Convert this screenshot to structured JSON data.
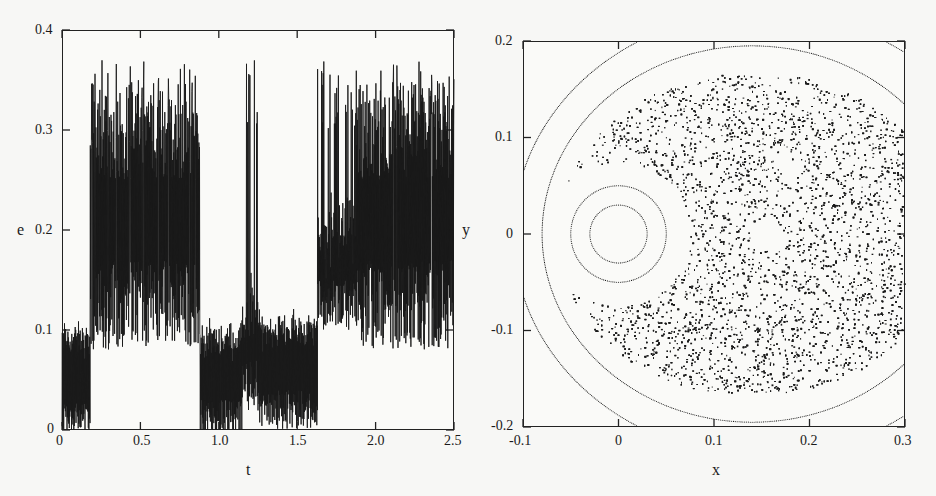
{
  "chart_data": [
    {
      "type": "line",
      "title": "",
      "xlabel": "t",
      "ylabel": "e",
      "xlim": [
        0,
        2.5
      ],
      "ylim": [
        0,
        0.4
      ],
      "x_ticks": [
        "0",
        "0.5",
        "1.0",
        "1.5",
        "2.0",
        "2.5"
      ],
      "y_ticks": [
        "0",
        "0.1",
        "0.2",
        "0.3",
        "0.4"
      ],
      "grid": false,
      "legend": null,
      "description": "Eccentricity e(t): rapidly oscillating signal switching between low state (~0.03-0.1) and high state (~0.15-0.36)",
      "segments": [
        {
          "t_start": 0.0,
          "t_end": 0.18,
          "state": "low",
          "band": [
            0.0,
            0.1
          ],
          "mean": 0.07
        },
        {
          "t_start": 0.18,
          "t_end": 0.88,
          "state": "high",
          "band": [
            0.1,
            0.36
          ],
          "mean": 0.2
        },
        {
          "t_start": 0.88,
          "t_end": 1.15,
          "state": "low",
          "band": [
            0.0,
            0.1
          ],
          "mean": 0.07
        },
        {
          "t_start": 1.15,
          "t_end": 1.25,
          "state": "spikes",
          "band": [
            0.05,
            0.37
          ],
          "mean": 0.12
        },
        {
          "t_start": 1.25,
          "t_end": 1.63,
          "state": "low",
          "band": [
            0.0,
            0.12
          ],
          "mean": 0.08
        },
        {
          "t_start": 1.63,
          "t_end": 1.88,
          "state": "spikes",
          "band": [
            0.1,
            0.37
          ],
          "mean": 0.2
        },
        {
          "t_start": 1.88,
          "t_end": 2.5,
          "state": "high",
          "band": [
            0.12,
            0.33
          ],
          "mean": 0.2
        }
      ],
      "peak_value": 0.37
    },
    {
      "type": "scatter",
      "title": "",
      "xlabel": "x",
      "ylabel": "y",
      "xlim": [
        -0.1,
        0.3
      ],
      "ylim": [
        -0.2,
        0.2
      ],
      "x_ticks": [
        "-0.1",
        "0",
        "0.1",
        "0.2",
        "0.3"
      ],
      "y_ticks": [
        "-0.2",
        "-0.1",
        "0",
        "0.1",
        "0.2"
      ],
      "grid": false,
      "legend": null,
      "description": "Poincare section: regular invariant circles around (0,0), chaotic sea filling x from ~-0.05 to 0.3, outer regular curves, small island near (0.15, 0)",
      "invariant_curves": [
        {
          "center": [
            0.0,
            0.0
          ],
          "radius": 0.03
        },
        {
          "center": [
            0.0,
            0.0
          ],
          "radius": 0.05
        },
        {
          "center": [
            0.14,
            0.0
          ],
          "rx": 0.22,
          "ry": 0.195
        },
        {
          "center": [
            0.15,
            0.0
          ],
          "rx": 0.26,
          "ry": 0.23
        }
      ],
      "chaotic_region": {
        "x_range": [
          -0.07,
          0.3
        ],
        "y_range": [
          -0.165,
          0.165
        ],
        "hole_center": [
          0.0,
          0.0
        ],
        "hole_radius": 0.075,
        "island_center": [
          0.155,
          0.0
        ]
      }
    }
  ],
  "left": {
    "xlabel": "t",
    "ylabel": "e",
    "x_ticks": [
      "0",
      "0.5",
      "1.0",
      "1.5",
      "2.0",
      "2.5"
    ],
    "y_ticks": [
      "0",
      "0.1",
      "0.2",
      "0.3",
      "0.4"
    ]
  },
  "right": {
    "xlabel": "x",
    "ylabel": "y",
    "x_ticks": [
      "-0.1",
      "0",
      "0.1",
      "0.2",
      "0.3"
    ],
    "y_ticks": [
      "-0.2",
      "-0.1",
      "0",
      "0.1",
      "0.2"
    ]
  },
  "colors": {
    "ink": "#1a1a1a",
    "background": "#f7f7f5"
  }
}
